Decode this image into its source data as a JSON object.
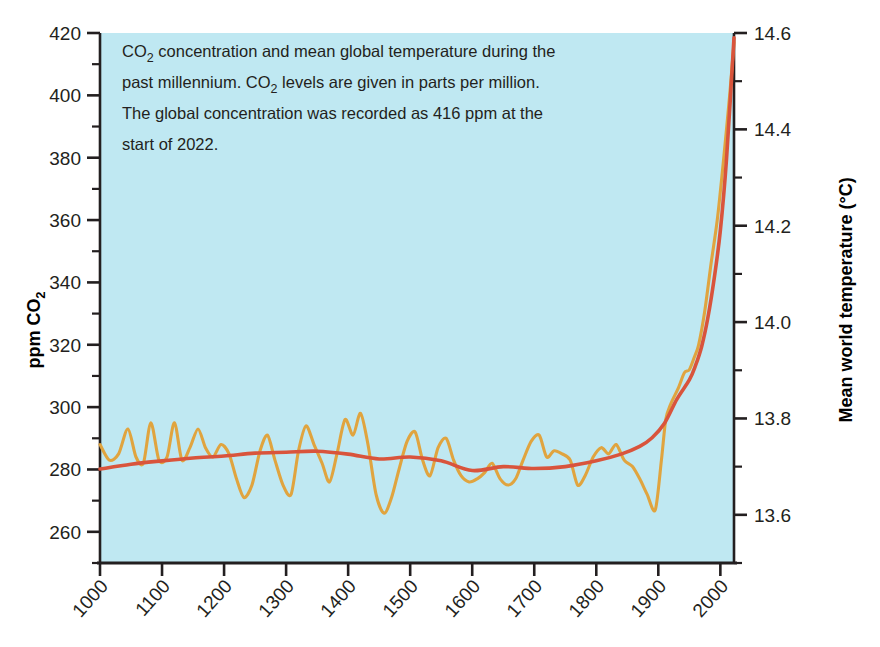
{
  "figure": {
    "plot_background_color": "#bfe8f2",
    "caption": {
      "line1": "CO₂ concentration and mean global temperature during the",
      "line2": "past millennium. CO₂ levels are given in parts per million.",
      "line3": "The global concentration was recorded as 416 ppm at the",
      "line4": "start of 2022."
    }
  },
  "chart_data": {
    "type": "line",
    "title": "",
    "subtitle": "",
    "annotations": [
      "CO₂ concentration and mean global temperature during the past millennium. CO₂ levels are given in parts per million. The global concentration was recorded as 416 ppm at the start of 2022."
    ],
    "xlabel": "",
    "xlim": [
      1000,
      2022
    ],
    "x_ticks": [
      1000,
      1100,
      1200,
      1300,
      1400,
      1500,
      1600,
      1700,
      1800,
      1900,
      2000
    ],
    "x_tick_labels": [
      "1000",
      "1100",
      "1200",
      "1300",
      "1400",
      "1500",
      "1600",
      "1700",
      "1800",
      "1900",
      "2000"
    ],
    "grid": false,
    "legend": "none",
    "axes": [
      {
        "side": "left",
        "label": "ppm CO₂",
        "label_parts": {
          "prefix": "ppm CO",
          "sub": "2"
        },
        "lim": [
          250,
          420
        ],
        "ticks": [
          260,
          280,
          300,
          320,
          340,
          360,
          380,
          400,
          420
        ],
        "tick_labels": [
          "260",
          "280",
          "300",
          "320",
          "340",
          "360",
          "380",
          "400",
          "420"
        ],
        "minor_tick_step": 10,
        "color": "#e0a43f"
      },
      {
        "side": "right",
        "label": "Mean world temperature (°C)",
        "lim": [
          13.5,
          14.6
        ],
        "ticks": [
          13.6,
          13.8,
          14.0,
          14.2,
          14.4,
          14.6
        ],
        "tick_labels": [
          "13.6",
          "13.8",
          "14.0",
          "14.2",
          "14.4",
          "14.6"
        ],
        "minor_tick_step": 0.1,
        "color": "#d9543c"
      }
    ],
    "series": [
      {
        "name": "CO2 concentration",
        "axis": "left",
        "units": "ppm",
        "color": "#e0a43f",
        "x": [
          1000,
          1015,
          1030,
          1045,
          1058,
          1070,
          1082,
          1095,
          1108,
          1120,
          1132,
          1145,
          1158,
          1170,
          1182,
          1195,
          1208,
          1220,
          1232,
          1245,
          1258,
          1270,
          1282,
          1295,
          1308,
          1320,
          1332,
          1345,
          1358,
          1370,
          1382,
          1395,
          1408,
          1420,
          1432,
          1445,
          1458,
          1470,
          1482,
          1495,
          1508,
          1520,
          1532,
          1545,
          1558,
          1570,
          1582,
          1595,
          1608,
          1620,
          1632,
          1645,
          1658,
          1670,
          1682,
          1695,
          1708,
          1720,
          1732,
          1745,
          1758,
          1770,
          1782,
          1795,
          1808,
          1820,
          1832,
          1845,
          1858,
          1870,
          1882,
          1895,
          1905,
          1912,
          1920,
          1932,
          1942,
          1950,
          1958,
          1965,
          1975,
          1985,
          1995,
          2005,
          2015,
          2022
        ],
        "y": [
          288,
          283,
          285,
          293,
          284,
          282,
          295,
          283,
          284,
          295,
          283,
          287,
          293,
          287,
          284,
          288,
          285,
          277,
          271,
          275,
          286,
          291,
          283,
          275,
          272,
          286,
          294,
          288,
          282,
          276,
          285,
          296,
          291,
          298,
          288,
          272,
          266,
          271,
          280,
          289,
          292,
          283,
          278,
          287,
          290,
          283,
          278,
          276,
          277,
          279,
          282,
          277,
          275,
          277,
          283,
          289,
          291,
          284,
          286,
          285,
          283,
          275,
          278,
          284,
          287,
          285,
          288,
          283,
          281,
          277,
          272,
          267,
          283,
          296,
          301,
          306,
          311,
          312,
          316,
          320,
          331,
          346,
          360,
          379,
          400,
          417
        ]
      },
      {
        "name": "Mean world temperature",
        "axis": "right",
        "units": "°C",
        "color": "#d9543c",
        "x": [
          1000,
          1050,
          1100,
          1150,
          1200,
          1250,
          1300,
          1350,
          1400,
          1450,
          1500,
          1550,
          1600,
          1650,
          1700,
          1750,
          1800,
          1840,
          1870,
          1890,
          1910,
          1930,
          1950,
          1960,
          1970,
          1980,
          1990,
          2000,
          2010,
          2022
        ],
        "y": [
          13.695,
          13.705,
          13.712,
          13.718,
          13.722,
          13.728,
          13.73,
          13.732,
          13.726,
          13.716,
          13.72,
          13.712,
          13.692,
          13.7,
          13.696,
          13.7,
          13.712,
          13.726,
          13.742,
          13.76,
          13.79,
          13.84,
          13.88,
          13.91,
          13.95,
          14.01,
          14.09,
          14.19,
          14.34,
          14.59
        ]
      }
    ]
  }
}
